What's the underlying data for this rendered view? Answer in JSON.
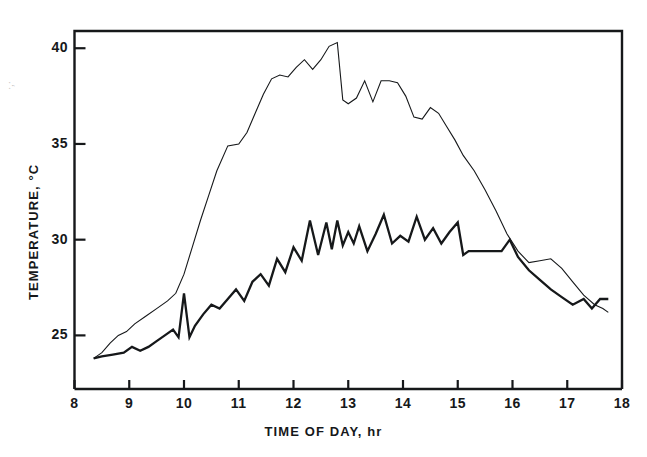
{
  "figure": {
    "background_color": "#ffffff",
    "line_color": "#16181a",
    "edge_artifact": "·,·"
  },
  "axes": {
    "x_title": "TIME OF DAY, hr",
    "y_title": "TEMPERATURE, °C",
    "x_tick_labels": [
      "8",
      "9",
      "10",
      "11",
      "12",
      "13",
      "14",
      "15",
      "16",
      "17",
      "18"
    ],
    "y_tick_labels": [
      "25",
      "30",
      "35",
      "40"
    ]
  },
  "chart_data": {
    "type": "line",
    "title": "",
    "xlabel": "TIME OF DAY, hr",
    "ylabel": "TEMPERATURE, °C",
    "xlim": [
      8,
      18
    ],
    "ylim": [
      22.2,
      40.9
    ],
    "xticks": [
      8,
      9,
      10,
      11,
      12,
      13,
      14,
      15,
      16,
      17,
      18
    ],
    "yticks": [
      25,
      30,
      35,
      40
    ],
    "grid": false,
    "legend": false,
    "legend_position": "none",
    "series": [
      {
        "name": "upper-curve",
        "line_width": 1.1,
        "x": [
          8.35,
          8.5,
          8.65,
          8.8,
          8.95,
          9.1,
          9.3,
          9.5,
          9.7,
          9.85,
          10.0,
          10.15,
          10.3,
          10.45,
          10.6,
          10.8,
          11.0,
          11.15,
          11.3,
          11.45,
          11.6,
          11.75,
          11.9,
          12.05,
          12.2,
          12.35,
          12.5,
          12.65,
          12.8,
          12.9,
          13.0,
          13.15,
          13.3,
          13.45,
          13.6,
          13.75,
          13.9,
          14.05,
          14.2,
          14.35,
          14.5,
          14.65,
          14.8,
          14.95,
          15.1,
          15.3,
          15.5,
          15.7,
          15.9,
          16.1,
          16.3,
          16.5,
          16.7,
          16.9,
          17.1,
          17.3,
          17.5,
          17.65,
          17.75
        ],
        "y": [
          23.8,
          24.1,
          24.6,
          25.0,
          25.2,
          25.6,
          26.0,
          26.4,
          26.8,
          27.2,
          28.2,
          29.6,
          31.0,
          32.3,
          33.6,
          34.9,
          35.0,
          35.6,
          36.6,
          37.6,
          38.4,
          38.6,
          38.5,
          39.0,
          39.4,
          38.9,
          39.4,
          40.1,
          40.3,
          37.3,
          37.1,
          37.4,
          38.3,
          37.2,
          38.3,
          38.3,
          38.2,
          37.5,
          36.4,
          36.3,
          36.9,
          36.6,
          35.9,
          35.2,
          34.4,
          33.6,
          32.6,
          31.5,
          30.3,
          29.4,
          28.8,
          28.9,
          29.0,
          28.5,
          27.8,
          27.1,
          26.6,
          26.4,
          26.2
        ]
      },
      {
        "name": "lower-curve",
        "line_width": 2.3,
        "x": [
          8.35,
          8.5,
          8.7,
          8.9,
          9.05,
          9.2,
          9.35,
          9.5,
          9.65,
          9.8,
          9.9,
          10.0,
          10.1,
          10.2,
          10.35,
          10.5,
          10.65,
          10.8,
          10.95,
          11.1,
          11.25,
          11.4,
          11.55,
          11.7,
          11.85,
          12.0,
          12.15,
          12.3,
          12.45,
          12.6,
          12.7,
          12.8,
          12.9,
          13.0,
          13.1,
          13.2,
          13.35,
          13.5,
          13.65,
          13.8,
          13.95,
          14.1,
          14.25,
          14.4,
          14.55,
          14.7,
          14.85,
          15.0,
          15.1,
          15.2,
          15.4,
          15.6,
          15.8,
          15.95,
          16.1,
          16.3,
          16.5,
          16.7,
          16.9,
          17.1,
          17.3,
          17.45,
          17.6,
          17.75
        ],
        "y": [
          23.8,
          23.9,
          24.0,
          24.1,
          24.4,
          24.2,
          24.4,
          24.7,
          25.0,
          25.3,
          24.9,
          27.2,
          24.9,
          25.5,
          26.1,
          26.6,
          26.4,
          26.9,
          27.4,
          26.8,
          27.8,
          28.2,
          27.6,
          29.0,
          28.3,
          29.6,
          28.9,
          31.0,
          29.2,
          30.9,
          29.5,
          31.0,
          29.7,
          30.4,
          29.8,
          30.7,
          29.4,
          30.3,
          31.3,
          29.8,
          30.2,
          29.9,
          31.2,
          30.0,
          30.6,
          29.8,
          30.4,
          30.9,
          29.2,
          29.4,
          29.4,
          29.4,
          29.4,
          30.0,
          29.1,
          28.4,
          27.9,
          27.4,
          27.0,
          26.6,
          26.9,
          26.4,
          26.9,
          26.9
        ]
      }
    ]
  }
}
